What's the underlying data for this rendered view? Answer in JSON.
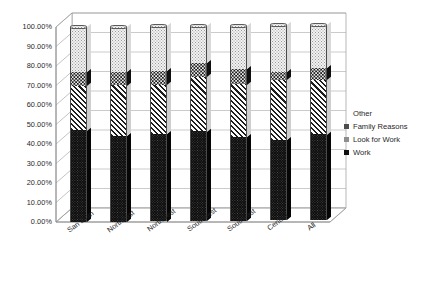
{
  "chart_data": {
    "type": "bar",
    "subtype": "stacked-column-3d",
    "title": "",
    "xlabel": "",
    "ylabel": "",
    "ylim": [
      0,
      100
    ],
    "ytick_labels": [
      "0.00%",
      "10.00%",
      "20.00%",
      "30.00%",
      "40.00%",
      "50.00%",
      "60.00%",
      "70.00%",
      "80.00%",
      "90.00%",
      "100.00%"
    ],
    "ytick_values": [
      0,
      10,
      20,
      30,
      40,
      50,
      60,
      70,
      80,
      90,
      100
    ],
    "grid": true,
    "legend_position": "right",
    "stack_order_bottom_to_top": [
      "Work",
      "Look for Work",
      "Family Reasons",
      "Other"
    ],
    "categories": [
      "San Juan",
      "Northeast",
      "Northwest",
      "Southwest",
      "Southeast",
      "Central",
      "All"
    ],
    "series": [
      {
        "name": "Work",
        "values": [
          47,
          44,
          45,
          46,
          43,
          41,
          44
        ]
      },
      {
        "name": "Look for Work",
        "values": [
          23,
          26,
          25,
          28,
          27,
          31,
          28
        ]
      },
      {
        "name": "Family Reasons",
        "values": [
          7,
          7,
          7,
          7,
          8,
          4,
          6
        ]
      },
      {
        "name": "Other",
        "values": [
          23,
          23,
          23,
          19,
          22,
          24,
          22
        ]
      }
    ],
    "legend_entries": [
      "Other",
      "Family Reasons",
      "Look for Work",
      "Work"
    ],
    "colors": {
      "work": "#0d0d0d",
      "look_for_work": "#fbfbfb",
      "family_reasons": "#1c1c1c",
      "other": "#f2f2f2",
      "axis": "#808080",
      "gridline": "#a6a6a6",
      "text": "#1f1f1f",
      "background": "#ffffff"
    }
  }
}
